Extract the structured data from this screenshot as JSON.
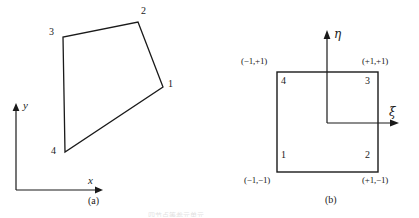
{
  "figure": {
    "width": 419,
    "height": 218,
    "background": "#ffffff",
    "ink_color": "#1a1a1a",
    "footer_partial_text": "四节点等参元单元"
  },
  "panel_a": {
    "caption": "(a)",
    "axes": {
      "x_label": "x",
      "y_label": "y",
      "origin": [
        16,
        190
      ],
      "x_tip": [
        103,
        190
      ],
      "y_tip": [
        16,
        104
      ]
    },
    "shape_type": "quadrilateral",
    "vertices": [
      {
        "id": "1",
        "label": "1",
        "x": 163,
        "y": 87,
        "label_x": 168,
        "label_y": 83
      },
      {
        "id": "2",
        "label": "2",
        "x": 138,
        "y": 22,
        "label_x": 141,
        "label_y": 10
      },
      {
        "id": "3",
        "label": "3",
        "x": 63,
        "y": 37,
        "label_x": 50,
        "label_y": 31
      },
      {
        "id": "4",
        "label": "4",
        "x": 65,
        "y": 152,
        "label_x": 52,
        "label_y": 150
      }
    ]
  },
  "panel_b": {
    "caption": "(b)",
    "axes": {
      "xi_label": "ξ",
      "eta_label": "η",
      "origin": [
        327,
        123
      ],
      "xi_tip": [
        399,
        123
      ],
      "eta_tip": [
        327,
        31
      ]
    },
    "square": {
      "left": 277,
      "top": 72,
      "right": 378,
      "bottom": 172
    },
    "vertices": [
      {
        "id": "1",
        "label": "1",
        "coord": "(−1,−1)",
        "x": 277,
        "y": 172,
        "label_x": 281,
        "label_y": 159,
        "coord_x": 244,
        "coord_y": 176
      },
      {
        "id": "2",
        "label": "2",
        "coord": "(+1,−1)",
        "x": 378,
        "y": 172,
        "label_x": 365,
        "label_y": 159,
        "coord_x": 362,
        "coord_y": 176
      },
      {
        "id": "3",
        "label": "3",
        "coord": "(+1,+1)",
        "x": 378,
        "y": 72,
        "label_x": 365,
        "label_y": 76,
        "coord_x": 362,
        "coord_y": 57
      },
      {
        "id": "4",
        "label": "4",
        "coord": "(−1,+1)",
        "x": 277,
        "y": 72,
        "label_x": 281,
        "label_y": 76,
        "coord_x": 241,
        "coord_y": 57
      }
    ]
  }
}
